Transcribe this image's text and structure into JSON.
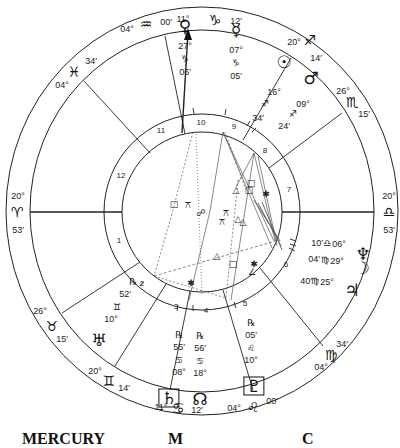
{
  "chart": {
    "center": [
      202,
      212
    ],
    "cusps": [
      {
        "id": "mc",
        "deg": "11°",
        "sign_glyph": "♑",
        "min": "12′",
        "pos_deg": [
          183,
          19
        ],
        "pos_glyph": [
          215,
          20
        ],
        "pos_min": [
          236,
          21
        ]
      },
      {
        "id": "c11",
        "deg": "04°",
        "sign_glyph": "♒",
        "min": "00′",
        "pos_deg": [
          127,
          29
        ],
        "pos_glyph": [
          146,
          24
        ],
        "pos_min": [
          166,
          22
        ]
      },
      {
        "id": "c12",
        "deg": "04°",
        "sign_glyph": "♓",
        "min": "34′",
        "pos_deg": [
          62,
          85
        ],
        "pos_glyph": [
          74,
          72
        ],
        "pos_min": [
          91,
          61
        ]
      },
      {
        "id": "asc",
        "deg": "20°",
        "sign_glyph": "♈",
        "min": "53′",
        "pos_deg": [
          18,
          196
        ],
        "pos_glyph": [
          17,
          212
        ],
        "pos_min": [
          18,
          230
        ]
      },
      {
        "id": "c2",
        "deg": "26°",
        "sign_glyph": "♉",
        "min": "15′",
        "pos_deg": [
          40,
          311
        ],
        "pos_glyph": [
          52,
          326
        ],
        "pos_min": [
          62,
          339
        ]
      },
      {
        "id": "c3",
        "deg": "20°",
        "sign_glyph": "♊",
        "min": "14′",
        "pos_deg": [
          95,
          371
        ],
        "pos_glyph": [
          109,
          381
        ],
        "pos_min": [
          124,
          388
        ]
      },
      {
        "id": "ic",
        "deg": "11°",
        "sign_glyph": "♋",
        "min": "12′",
        "pos_deg": [
          161,
          407
        ],
        "pos_glyph": [
          178,
          408
        ],
        "pos_min": [
          197,
          410
        ]
      },
      {
        "id": "c5",
        "deg": "04°",
        "sign_glyph": "♌",
        "min": "00′",
        "pos_deg": [
          234,
          408
        ],
        "pos_glyph": [
          253,
          407
        ],
        "pos_min": [
          272,
          401
        ]
      },
      {
        "id": "c6",
        "deg": "04°",
        "sign_glyph": "♍",
        "min": "34′",
        "pos_deg": [
          321,
          367
        ],
        "pos_glyph": [
          331,
          355
        ],
        "pos_min": [
          342,
          344
        ]
      },
      {
        "id": "dsc",
        "deg": "20°",
        "sign_glyph": "♎",
        "min": "53′",
        "pos_deg": [
          389,
          196
        ],
        "pos_glyph": [
          389,
          212
        ],
        "pos_min": [
          389,
          230
        ]
      },
      {
        "id": "c8",
        "deg": "26°",
        "sign_glyph": "♏",
        "min": "15′",
        "pos_deg": [
          343,
          91
        ],
        "pos_glyph": [
          352,
          102
        ],
        "pos_min": [
          364,
          114
        ]
      },
      {
        "id": "c9",
        "deg": "20°",
        "sign_glyph": "♐",
        "min": "14′",
        "pos_deg": [
          294,
          42
        ],
        "pos_glyph": [
          310,
          40
        ],
        "pos_min": [
          316,
          58
        ]
      }
    ],
    "houses": [
      {
        "n": "1",
        "pos": [
          119,
          240
        ]
      },
      {
        "n": "2",
        "pos": [
          142,
          283
        ]
      },
      {
        "n": "3",
        "pos": [
          176,
          306
        ]
      },
      {
        "n": "4",
        "pos": [
          206,
          310
        ]
      },
      {
        "n": "5",
        "pos": [
          245,
          303
        ]
      },
      {
        "n": "6",
        "pos": [
          286,
          264
        ]
      },
      {
        "n": "7",
        "pos": [
          289,
          189
        ]
      },
      {
        "n": "8",
        "pos": [
          265,
          150
        ]
      },
      {
        "n": "9",
        "pos": [
          234,
          126
        ]
      },
      {
        "n": "10",
        "pos": [
          201,
          122
        ]
      },
      {
        "n": "11",
        "pos": [
          161,
          130
        ]
      },
      {
        "n": "12",
        "pos": [
          121,
          175
        ]
      }
    ],
    "planets": [
      {
        "name": "Venus",
        "glyph": "♀",
        "lines": [
          "27°",
          "♑",
          "06′"
        ],
        "pos": [
          185,
          46
        ],
        "retro": false
      },
      {
        "name": "Mercury",
        "glyph": "☿",
        "lines": [
          "07°",
          "♑",
          "05′"
        ],
        "pos": [
          236,
          50
        ],
        "retro": false
      },
      {
        "name": "Sun",
        "glyph": "☉",
        "lines": [
          "16°",
          "♐",
          "34′"
        ],
        "pos": [
          284,
          76
        ],
        "retro": false
      },
      {
        "name": "Mars",
        "glyph": "♂",
        "lines": [
          "09°",
          "♐",
          "24′"
        ],
        "pos": [
          311,
          92
        ],
        "retro": false
      },
      {
        "name": "Neptune",
        "glyph": "♆",
        "lines": [
          "10′",
          "♎",
          "06°"
        ],
        "pos": [
          363,
          254
        ],
        "retro": false
      },
      {
        "name": "Moon",
        "glyph": "☽",
        "lines": [
          "04′",
          "♍",
          "29°"
        ],
        "pos": [
          362,
          268
        ],
        "retro": false
      },
      {
        "name": "Jupiter",
        "glyph": "♃",
        "lines": [
          "40′",
          "♍",
          "25°"
        ],
        "pos": [
          352,
          290
        ],
        "retro": false
      },
      {
        "name": "Uranus",
        "glyph": "♅",
        "lines": [
          "10°",
          "♊",
          "52′"
        ],
        "pos": [
          99,
          340
        ],
        "retro": true
      },
      {
        "name": "Saturn",
        "glyph": "♄",
        "lines": [
          "08°",
          "♋",
          "55′"
        ],
        "pos": [
          169,
          398
        ],
        "retro": true,
        "boxed": true
      },
      {
        "name": "North Node",
        "glyph": "☊",
        "lines": [
          "18°",
          "♋",
          "56′"
        ],
        "pos": [
          200,
          399
        ],
        "retro": true
      },
      {
        "name": "Pluto",
        "glyph": "♇",
        "lines": [
          "10°",
          "♌",
          "05′"
        ],
        "pos": [
          254,
          386
        ],
        "retro": true,
        "boxed": true
      }
    ],
    "aspect_symbols": [
      {
        "glyph": "□",
        "pos": [
          174,
          204
        ]
      },
      {
        "glyph": "⚻",
        "pos": [
          188,
          205
        ]
      },
      {
        "glyph": "☍",
        "pos": [
          201,
          213
        ]
      },
      {
        "glyph": "⚻",
        "pos": [
          226,
          213
        ]
      },
      {
        "glyph": "⚻",
        "pos": [
          222,
          222
        ]
      },
      {
        "glyph": "△",
        "pos": [
          236,
          190
        ]
      },
      {
        "glyph": "□",
        "pos": [
          251,
          183
        ]
      },
      {
        "glyph": "□",
        "pos": [
          249,
          190
        ]
      },
      {
        "glyph": "✱",
        "pos": [
          266,
          194
        ]
      },
      {
        "glyph": "△",
        "pos": [
          238,
          219
        ]
      },
      {
        "glyph": "△",
        "pos": [
          243,
          222
        ]
      },
      {
        "glyph": "△",
        "pos": [
          217,
          256
        ]
      },
      {
        "glyph": "□",
        "pos": [
          233,
          264
        ]
      },
      {
        "glyph": "✱",
        "pos": [
          254,
          264
        ]
      },
      {
        "glyph": "∠",
        "pos": [
          252,
          272
        ]
      },
      {
        "glyph": "✱",
        "pos": [
          191,
          283
        ]
      }
    ],
    "retro_glyph": "℞"
  },
  "footer": {
    "labels": [
      "MERCURY",
      "M",
      "C"
    ]
  }
}
